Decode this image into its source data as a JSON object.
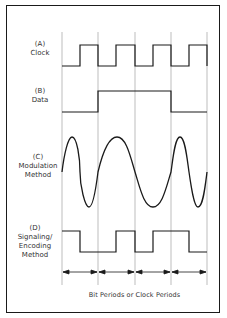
{
  "diagram": {
    "labels": {
      "a": {
        "tag": "(A)",
        "line1": "Clock",
        "line2": ""
      },
      "b": {
        "tag": "(B)",
        "line1": "Data",
        "line2": ""
      },
      "c": {
        "tag": "(C)",
        "line1": "Modulation",
        "line2": "Method"
      },
      "d": {
        "tag": "(D)",
        "line1": "Signaling/",
        "line2": "Encoding",
        "line3": "Method"
      }
    },
    "caption": "Bit Periods or Clock Periods",
    "bit_periods": 4,
    "data_bits": [
      0,
      1,
      1,
      0
    ],
    "colors": {
      "line": "#1a1a1a",
      "grid": "#999999",
      "text": "#333333"
    }
  }
}
